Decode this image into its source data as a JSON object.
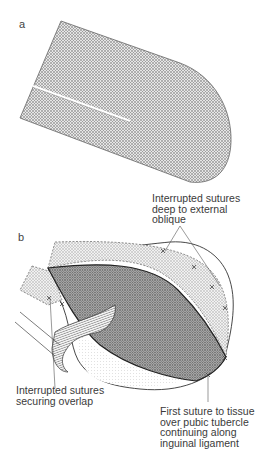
{
  "figure": {
    "panel_a": {
      "label": "a"
    },
    "panel_b": {
      "label": "b",
      "callouts": {
        "top": "Interrupted sutures\ndeep to external\noblique",
        "left": "Interrupted sutures\nsecuring overlap",
        "bottom": "First suture to tissue\nover pubic tubercle\ncontinuing along\ninguinal ligament"
      }
    }
  },
  "colors": {
    "mesh_light": "#c8c8c8",
    "mesh_dark": "#9a9a9a",
    "outline": "#333333",
    "text": "#3a3a3a"
  }
}
